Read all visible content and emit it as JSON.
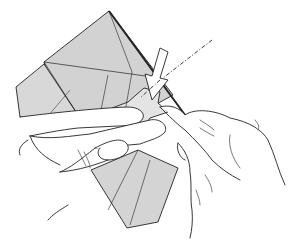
{
  "illustration": {
    "subject": "origami folding step",
    "description": "Two hands folding a grey square paper model; a hollow white arrow points down into a pocket with a dash-dot fold line",
    "colors": {
      "paper": "#d4d4d4",
      "paper_light": "#e2e2e2",
      "line": "#222222",
      "background": "#ffffff",
      "arrow_fill": "#ffffff"
    }
  }
}
